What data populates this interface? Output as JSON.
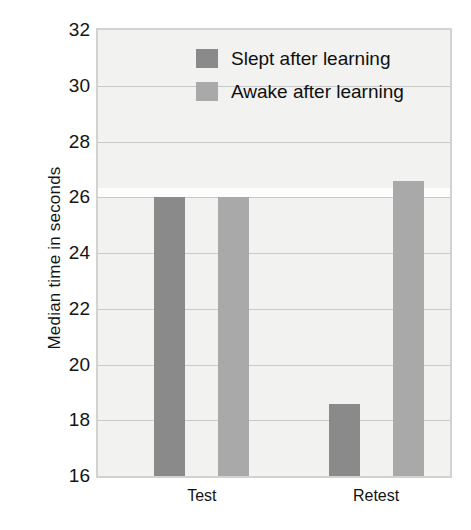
{
  "chart_data": {
    "type": "bar",
    "title": "",
    "subtitle": "",
    "xlabel": "",
    "ylabel": "Median time in seconds",
    "categories": [
      "Test",
      "Retest"
    ],
    "series": [
      {
        "name": "Slept after learning",
        "color": "#8a8a8a",
        "values": [
          26.0,
          18.6
        ]
      },
      {
        "name": "Awake after learning",
        "color": "#a9a9a9",
        "values": [
          26.0,
          26.6
        ]
      }
    ],
    "ylim": [
      16,
      32
    ],
    "yticks": [
      16,
      18,
      20,
      22,
      24,
      26,
      28,
      30,
      32
    ],
    "ytick_labels": [
      "16",
      "18",
      "20",
      "22",
      "24",
      "26",
      "28",
      "30",
      "32"
    ],
    "grid": true,
    "grid_axis": "y",
    "legend_position": "upper-center",
    "plot_background": "#f2f2f0",
    "plot_border_color": "#d2d2d0",
    "gridline_color": "#c9c9c7"
  },
  "axis": {
    "y_title": "Median time in seconds"
  },
  "legend": {
    "entries": [
      {
        "label": "Slept after learning",
        "color": "#8a8a8a"
      },
      {
        "label": "Awake after learning",
        "color": "#a9a9a9"
      }
    ]
  },
  "x_axis": {
    "ticks": [
      "Test",
      "Retest"
    ]
  }
}
